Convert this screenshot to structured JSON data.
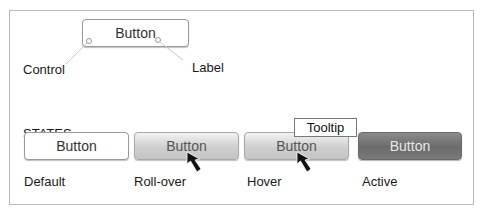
{
  "anatomy": {
    "button_label": "Button",
    "callouts": {
      "control": "Control",
      "label": "Label"
    }
  },
  "states": {
    "heading": "STATES",
    "items": [
      {
        "state": "Default",
        "button_label": "Button"
      },
      {
        "state": "Roll-over",
        "button_label": "Button"
      },
      {
        "state": "Hover",
        "button_label": "Button",
        "tooltip": "Tooltip"
      },
      {
        "state": "Active",
        "button_label": "Button"
      }
    ]
  },
  "icons": {
    "cursor": "arrow-pointer"
  },
  "colors": {
    "frame_border": "#b9b9b9",
    "default_bg": "#ffffff",
    "rollover_bg": "#d4d4d4",
    "active_bg": "#777777",
    "callout_line": "#c8c8c8"
  }
}
